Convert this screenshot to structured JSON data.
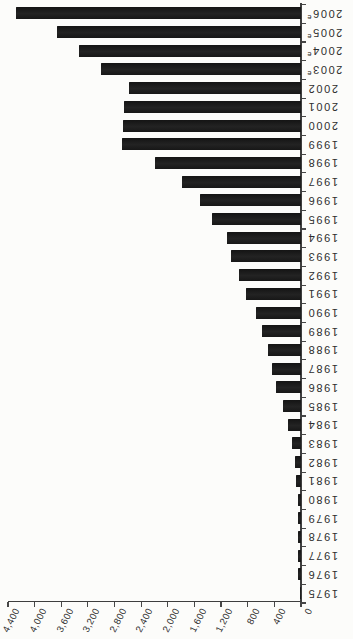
{
  "page": {
    "background": "#fcfcfa"
  },
  "chart_data": {
    "type": "bar",
    "title": "",
    "xlabel": "",
    "ylabel": "",
    "orientation": "rotated-90ccw: baseline axis on right edge, bars extend leftward, year labels read upside-down, value axis along bottom reading right-to-left from 0",
    "bar_color": "#1d1d1d",
    "axis_color": "#3e3e3e",
    "label_color": "#2e2e2e",
    "grid": "off",
    "legend": "none",
    "value_axis": {
      "min": 0,
      "max": 4400,
      "tick_step": 400,
      "tick_labels": [
        "4,400",
        "4,000",
        "3,600",
        "3,200",
        "2,800",
        "2,400",
        "2,000",
        "1,600",
        "1,200",
        "800",
        "400",
        "0"
      ]
    },
    "bars": [
      {
        "label": "2006",
        "sup": "e",
        "value": 4280
      },
      {
        "label": "2005",
        "sup": "e",
        "value": 3670
      },
      {
        "label": "2004",
        "sup": "e",
        "value": 3330
      },
      {
        "label": "2003",
        "sup": "e",
        "value": 3010
      },
      {
        "label": "2002",
        "sup": "",
        "value": 2590
      },
      {
        "label": "2001",
        "sup": "",
        "value": 2660
      },
      {
        "label": "2000",
        "sup": "",
        "value": 2680
      },
      {
        "label": "1999",
        "sup": "",
        "value": 2690
      },
      {
        "label": "1998",
        "sup": "",
        "value": 2190
      },
      {
        "label": "1997",
        "sup": "",
        "value": 1780
      },
      {
        "label": "1996",
        "sup": "",
        "value": 1520
      },
      {
        "label": "1995",
        "sup": "",
        "value": 1340
      },
      {
        "label": "1994",
        "sup": "",
        "value": 1110
      },
      {
        "label": "1993",
        "sup": "",
        "value": 1050
      },
      {
        "label": "1992",
        "sup": "",
        "value": 925
      },
      {
        "label": "1991",
        "sup": "",
        "value": 820
      },
      {
        "label": "1990",
        "sup": "",
        "value": 680
      },
      {
        "label": "1989",
        "sup": "",
        "value": 580
      },
      {
        "label": "1988",
        "sup": "",
        "value": 490
      },
      {
        "label": "1987",
        "sup": "",
        "value": 440
      },
      {
        "label": "1986",
        "sup": "",
        "value": 370
      },
      {
        "label": "1985",
        "sup": "",
        "value": 270
      },
      {
        "label": "1984",
        "sup": "",
        "value": 190
      },
      {
        "label": "1983",
        "sup": "",
        "value": 130
      },
      {
        "label": "1982",
        "sup": "",
        "value": 95
      },
      {
        "label": "1981",
        "sup": "",
        "value": 80
      },
      {
        "label": "1980",
        "sup": "",
        "value": 45
      },
      {
        "label": "1979",
        "sup": "",
        "value": 40
      },
      {
        "label": "1978",
        "sup": "",
        "value": 45
      },
      {
        "label": "1977",
        "sup": "",
        "value": 40
      },
      {
        "label": "1976",
        "sup": "",
        "value": 50
      },
      {
        "label": "1975",
        "sup": "",
        "value": 10
      }
    ]
  }
}
